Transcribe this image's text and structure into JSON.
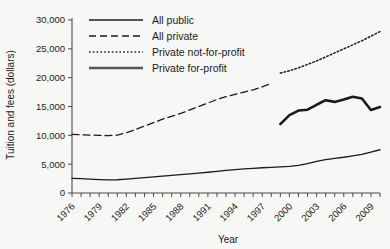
{
  "chart_data": {
    "type": "line",
    "title": "",
    "xlabel": "Year",
    "ylabel": "Tuition and fees (dollars)",
    "xlim": [
      1976,
      2010
    ],
    "ylim": [
      0,
      30000
    ],
    "grid": false,
    "legend_position": "top-center",
    "y_ticks": [
      0,
      5000,
      10000,
      15000,
      20000,
      25000,
      30000
    ],
    "y_tick_labels": [
      "0",
      "5,000",
      "10,000",
      "15,000",
      "20,000",
      "25,000",
      "30,000"
    ],
    "x_ticks": [
      1976,
      1979,
      1982,
      1985,
      1988,
      1991,
      1994,
      1997,
      2000,
      2003,
      2006,
      2009
    ],
    "x_tick_labels": [
      "1976",
      "1979",
      "1982",
      "1985",
      "1988",
      "1991",
      "1994",
      "1997",
      "2000",
      "2003",
      "2006",
      "2009"
    ],
    "x_minor_ticks": [
      1976,
      1977,
      1978,
      1979,
      1980,
      1981,
      1982,
      1983,
      1984,
      1985,
      1986,
      1987,
      1988,
      1989,
      1990,
      1991,
      1992,
      1993,
      1994,
      1995,
      1996,
      1997,
      1998,
      1999,
      2000,
      2001,
      2002,
      2003,
      2004,
      2005,
      2006,
      2007,
      2008,
      2009,
      2010
    ],
    "series": [
      {
        "name": "All public",
        "style": "solid",
        "width": 1.3,
        "color": "#1b1b1b",
        "x": [
          1976,
          1977,
          1978,
          1979,
          1980,
          1981,
          1982,
          1983,
          1984,
          1985,
          1986,
          1987,
          1988,
          1989,
          1990,
          1991,
          1992,
          1993,
          1994,
          1995,
          1996,
          1997,
          1998,
          1999,
          2000,
          2001,
          2002,
          2003,
          2004,
          2005,
          2006,
          2007,
          2008,
          2009,
          2010
        ],
        "values": [
          2540,
          2480,
          2390,
          2330,
          2280,
          2300,
          2420,
          2550,
          2680,
          2800,
          2920,
          3050,
          3180,
          3320,
          3450,
          3600,
          3760,
          3920,
          4050,
          4180,
          4280,
          4380,
          4450,
          4520,
          4600,
          4800,
          5100,
          5500,
          5800,
          6000,
          6200,
          6450,
          6700,
          7100,
          7500
        ]
      },
      {
        "name": "All private",
        "style": "dashed",
        "width": 1.3,
        "color": "#1b1b1b",
        "x": [
          1976,
          1977,
          1978,
          1979,
          1980,
          1981,
          1982,
          1983,
          1984,
          1985,
          1986,
          1987,
          1988,
          1989,
          1990,
          1991,
          1992,
          1993,
          1994,
          1995,
          1996,
          1997,
          1998
        ],
        "values": [
          10150,
          10100,
          10050,
          10000,
          9950,
          10050,
          10450,
          11000,
          11600,
          12200,
          12800,
          13300,
          13800,
          14400,
          15000,
          15600,
          16200,
          16700,
          17100,
          17500,
          17900,
          18400,
          19000
        ]
      },
      {
        "name": "Private not-for-profit",
        "style": "dotted",
        "width": 1.5,
        "color": "#1b1b1b",
        "x": [
          1999,
          2000,
          2001,
          2002,
          2003,
          2004,
          2005,
          2006,
          2007,
          2008,
          2009,
          2010
        ],
        "values": [
          20800,
          21200,
          21700,
          22300,
          22900,
          23600,
          24300,
          25000,
          25700,
          26400,
          27200,
          28000
        ]
      },
      {
        "name": "Private for-profit",
        "style": "thick",
        "width": 2.6,
        "color": "#555555",
        "x": [
          1999,
          2000,
          2001,
          2002,
          2003,
          2004,
          2005,
          2006,
          2007,
          2008,
          2009,
          2010
        ],
        "values": [
          11950,
          13500,
          14300,
          14450,
          15300,
          16100,
          15800,
          16200,
          16700,
          16400,
          14400,
          14900
        ]
      }
    ]
  },
  "legend": {
    "items": [
      {
        "label": "All public"
      },
      {
        "label": "All private"
      },
      {
        "label": "Private not-for-profit"
      },
      {
        "label": "Private for-profit"
      }
    ]
  },
  "colors": {
    "background": "#f7f7f5",
    "axis": "#4a4a4a",
    "ink": "#1b1b1b",
    "forprofit": "#555555"
  }
}
